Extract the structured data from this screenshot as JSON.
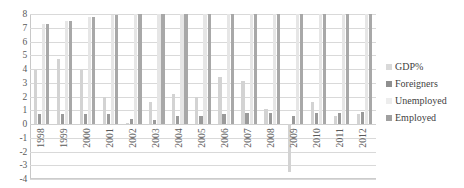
{
  "chart_data": {
    "type": "bar",
    "title": "",
    "xlabel": "",
    "ylabel": "",
    "ylim": [
      -4,
      8
    ],
    "ytick_labels": [
      "8",
      "7",
      "6",
      "5",
      "4",
      "3",
      "2",
      "1",
      "0",
      "-1",
      "-2",
      "-3",
      "-4"
    ],
    "grid": true,
    "legend_position": "right",
    "categories": [
      "1998",
      "1999",
      "2000",
      "2001",
      "2002",
      "2003",
      "2004",
      "2005",
      "2006",
      "2007",
      "2008",
      "2009",
      "2010",
      "2011",
      "2012"
    ],
    "series": [
      {
        "name": "GDP%",
        "color": "#d3d3d3",
        "values": [
          3.9,
          4.7,
          3.9,
          2.0,
          0.1,
          1.6,
          2.2,
          2.0,
          3.4,
          3.1,
          1.1,
          -3.5,
          1.6,
          0.6,
          0.7
        ]
      },
      {
        "name": "Foreigners",
        "color": "#9a9a9a",
        "values": [
          0.7,
          0.7,
          0.7,
          0.7,
          0.4,
          0.3,
          0.6,
          0.6,
          0.7,
          0.8,
          0.8,
          0.6,
          0.8,
          0.8,
          0.9
        ]
      },
      {
        "name": "Unemployed",
        "color": "#e6e6e6",
        "values": [
          7.3,
          7.5,
          7.8,
          7.9,
          8.0,
          8.0,
          8.0,
          8.0,
          8.0,
          8.0,
          8.0,
          8.0,
          8.0,
          8.0,
          8.0
        ]
      },
      {
        "name": "Employed",
        "color": "#a8a8a8",
        "values": [
          7.3,
          7.5,
          7.8,
          7.9,
          8.0,
          8.0,
          8.0,
          8.0,
          8.0,
          8.0,
          8.0,
          8.0,
          8.0,
          8.0,
          8.0
        ]
      }
    ]
  },
  "legend": {
    "items": [
      {
        "label": "GDP%",
        "color": "#d9d9d9"
      },
      {
        "label": "Foreigners",
        "color": "#8f8f8f"
      },
      {
        "label": "Unemployed",
        "color": "#ededed"
      },
      {
        "label": "Employed",
        "color": "#a0a0a0"
      }
    ]
  }
}
